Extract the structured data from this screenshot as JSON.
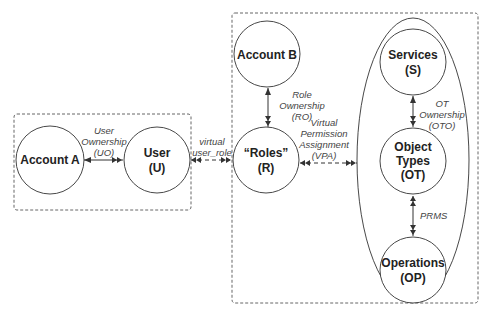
{
  "diagram": {
    "groups": [
      {
        "id": "left-group",
        "style": "dashed"
      },
      {
        "id": "right-group",
        "style": "dashed"
      },
      {
        "id": "object-ellipse",
        "style": "solid"
      }
    ],
    "nodes": {
      "account_a": {
        "line1": "Account A",
        "line2": ""
      },
      "user": {
        "line1": "User",
        "line2": "(U)"
      },
      "account_b": {
        "line1": "Account B",
        "line2": ""
      },
      "roles": {
        "line1": "“Roles”",
        "line2": "(R)"
      },
      "services": {
        "line1": "Services",
        "line2": "(S)"
      },
      "object_types": {
        "line1": "Object",
        "line2": "Types",
        "line3": "(OT)"
      },
      "operations": {
        "line1": "Operations",
        "line2": "(OP)"
      }
    },
    "edges": {
      "uo": {
        "line1": "User",
        "line2": "Ownership",
        "line3": "(UO)",
        "style": "solid"
      },
      "user_role": {
        "line1": "virtual",
        "line2": "user_role",
        "style": "dashed"
      },
      "ro": {
        "line1": "Role",
        "line2": "Ownership",
        "line3": "(RO)",
        "style": "solid"
      },
      "vpa": {
        "line1": "Virtual",
        "line2": "Permission",
        "line3": "Assignment",
        "line4": "(VPA)",
        "style": "dashed"
      },
      "oto": {
        "line1": "OT",
        "line2": "Ownership",
        "line3": "(OTO)",
        "style": "solid"
      },
      "prms": {
        "line1": "PRMS",
        "style": "solid"
      }
    }
  }
}
